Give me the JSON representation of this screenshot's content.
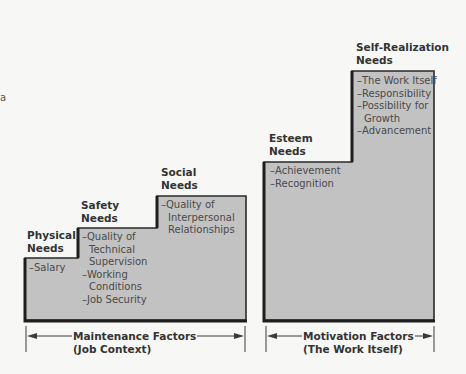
{
  "diagram": {
    "type": "staircase-needs-hierarchy",
    "colors": {
      "fill": "#c2c2c2",
      "border": "#2a2a2a",
      "background": "#f7f7f5",
      "text": "#3a3a3a"
    },
    "edge_mark": "a"
  },
  "maintenance": {
    "steps": [
      {
        "title_line1": "Physical",
        "title_line2": "Needs",
        "items": [
          "–Salary"
        ]
      },
      {
        "title_line1": "Safety",
        "title_line2": "Needs",
        "items": [
          "–Quality of",
          "Technical",
          "Supervision",
          "–Working",
          "Conditions",
          "–Job Security"
        ]
      },
      {
        "title_line1": "Social",
        "title_line2": "Needs",
        "items": [
          "–Quality of",
          "Interpersonal",
          "Relationships"
        ]
      }
    ],
    "factor_line1": "Maintenance Factors",
    "factor_line2": "(Job Context)"
  },
  "motivation": {
    "steps": [
      {
        "title_line1": "Esteem",
        "title_line2": "Needs",
        "items": [
          "–Achievement",
          "–Recognition"
        ]
      },
      {
        "title_line1": "Self-Realization",
        "title_line2": "Needs",
        "items": [
          "–The Work Itself",
          "–Responsibility",
          "–Possibility for",
          "Growth",
          "–Advancement"
        ]
      }
    ],
    "factor_line1": "Motivation Factors",
    "factor_line2": "(The Work Itself)"
  }
}
